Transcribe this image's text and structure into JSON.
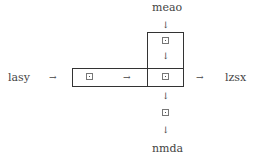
{
  "diagram": {
    "nodes": {
      "top": "meao",
      "left": "lasy",
      "right": "lzsx",
      "bottom": "nmda"
    },
    "arrows": {
      "right": "→",
      "down": "↓"
    }
  }
}
